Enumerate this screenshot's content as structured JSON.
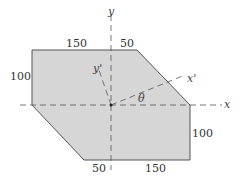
{
  "diagram": {
    "type": "cross-section-area",
    "fill_color": "#d6d6d6",
    "edge_color": "#555555",
    "axes": {
      "x": "x",
      "y": "y",
      "x_prime": "x'",
      "y_prime": "y'",
      "angle": "θ"
    },
    "dimensions": {
      "top_left": "150",
      "top_right": "50",
      "left": "100",
      "right": "100",
      "bottom_left": "50",
      "bottom_right": "150"
    }
  }
}
